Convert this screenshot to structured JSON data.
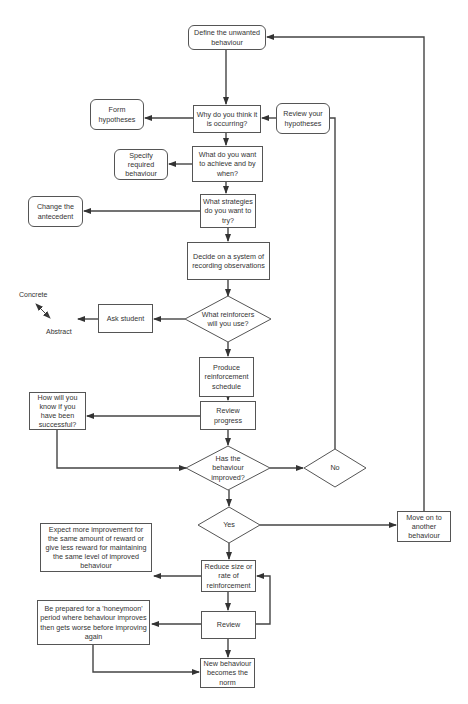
{
  "diagram": {
    "type": "flowchart",
    "nodes": {
      "define": "Define the unwanted behaviour",
      "why": "Why do you think it is occurring?",
      "form_hypotheses": "Form hypotheses",
      "review_hypotheses": "Review your hypotheses",
      "what_achieve": "What do you want to achieve and by when?",
      "specify_behaviour": "Specify required behaviour",
      "strategies": "What strategies do you want to try?",
      "change_antecedent": "Change the antecedent",
      "decide_recording": "Decide on a system of recording observations",
      "reinforcers": "What reinforcers will you use?",
      "ask_student": "Ask student",
      "produce_schedule": "Produce reinforcement schedule",
      "how_know": "How will you know if you have been successful?",
      "review_progress": "Review progress",
      "has_improved": "Has the behaviour improved?",
      "no": "No",
      "yes": "Yes",
      "move_on": "Move on to another behaviour",
      "expect_more": "Expect more improvement for the same amount of reward or give less reward for maintaining the same level of improved behaviour",
      "reduce": "Reduce size or rate of reinforcement",
      "review": "Review",
      "honeymoon": "Be prepared for a 'honeymoon' period where behaviour improves then gets worse before improving again",
      "new_norm": "New behaviour becomes the norm"
    },
    "scale": {
      "top": "Concrete",
      "bottom": "Abstract"
    },
    "edges": [
      [
        "define",
        "why"
      ],
      [
        "why",
        "form_hypotheses"
      ],
      [
        "review_hypotheses",
        "why"
      ],
      [
        "why",
        "what_achieve"
      ],
      [
        "what_achieve",
        "specify_behaviour"
      ],
      [
        "what_achieve",
        "strategies"
      ],
      [
        "strategies",
        "change_antecedent"
      ],
      [
        "strategies",
        "decide_recording"
      ],
      [
        "decide_recording",
        "reinforcers"
      ],
      [
        "reinforcers",
        "ask_student"
      ],
      [
        "reinforcers",
        "produce_schedule"
      ],
      [
        "produce_schedule",
        "review_progress"
      ],
      [
        "review_progress",
        "how_know"
      ],
      [
        "how_know",
        "has_improved"
      ],
      [
        "review_progress",
        "has_improved"
      ],
      [
        "has_improved",
        "no"
      ],
      [
        "no",
        "review_hypotheses"
      ],
      [
        "has_improved",
        "yes"
      ],
      [
        "yes",
        "move_on"
      ],
      [
        "move_on",
        "define"
      ],
      [
        "yes",
        "reduce"
      ],
      [
        "reduce",
        "expect_more"
      ],
      [
        "reduce",
        "review"
      ],
      [
        "review",
        "reduce"
      ],
      [
        "review",
        "honeymoon"
      ],
      [
        "review",
        "new_norm"
      ],
      [
        "honeymoon",
        "new_norm"
      ]
    ]
  }
}
